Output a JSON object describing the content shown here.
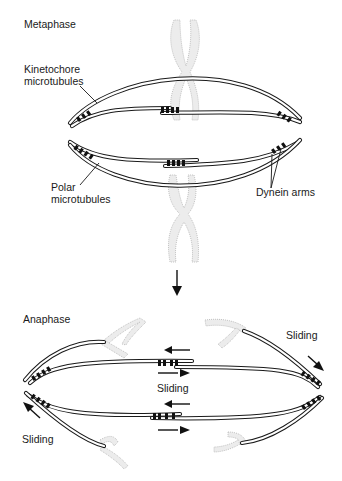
{
  "figure": {
    "panels": [
      {
        "name": "metaphase",
        "label": "Metaphase",
        "annotations": {
          "kinetochore": "Kinetochore\nmicrotubules",
          "polar": "Polar\nmicrotubules",
          "dynein": "Dynein arms"
        }
      },
      {
        "name": "anaphase",
        "label": "Anaphase",
        "annotations": {
          "sliding_right": "Sliding",
          "sliding_center": "Sliding",
          "sliding_left": "Sliding"
        }
      }
    ],
    "transition_arrow": "down-arrow"
  },
  "colors": {
    "ink": "#1a1a1a",
    "chromosome_fill": "#ececec",
    "chromosome_stroke": "#b5b5b5",
    "background": "#ffffff"
  }
}
